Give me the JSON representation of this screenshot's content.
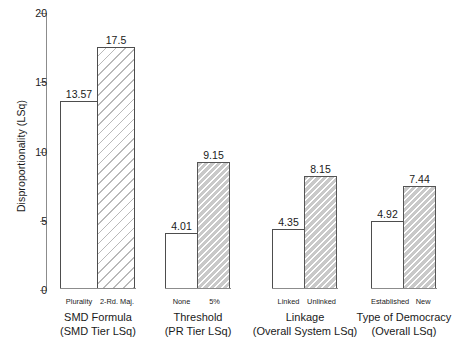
{
  "chart_data": {
    "type": "bar",
    "title": "",
    "xlabel": "",
    "ylabel": "Disproportionality (LSq)",
    "ylim": [
      0,
      20
    ],
    "yticks": [
      0,
      5,
      10,
      15,
      20
    ],
    "ytick_labels": [
      "0",
      "5",
      "10",
      "15",
      "20"
    ],
    "grid": false,
    "legend": "none",
    "groups": [
      {
        "name": "SMD Formula",
        "subtitle": "(SMD Tier LSq)",
        "bars": [
          {
            "category": "Plurality",
            "value": 13.57,
            "label": "13.57",
            "fill": "plain"
          },
          {
            "category": "2-Rd. Maj.",
            "value": 17.5,
            "label": "17.5",
            "fill": "hatch-light"
          }
        ]
      },
      {
        "name": "Threshold",
        "subtitle": "(PR Tier LSq)",
        "bars": [
          {
            "category": "None",
            "value": 4.01,
            "label": "4.01",
            "fill": "plain"
          },
          {
            "category": "5%",
            "value": 9.15,
            "label": "9.15",
            "fill": "hatch-dark"
          }
        ]
      },
      {
        "name": "Linkage",
        "subtitle": "(Overall System LSq)",
        "bars": [
          {
            "category": "Linked",
            "value": 4.35,
            "label": "4.35",
            "fill": "plain"
          },
          {
            "category": "Unlinked",
            "value": 8.15,
            "label": "8.15",
            "fill": "hatch-dark"
          }
        ]
      },
      {
        "name": "Type of Democracy",
        "subtitle": "(Overall LSq)",
        "bars": [
          {
            "category": "Established",
            "value": 4.92,
            "label": "4.92",
            "fill": "plain"
          },
          {
            "category": "New",
            "value": 7.44,
            "label": "7.44",
            "fill": "hatch-dark"
          }
        ]
      }
    ],
    "colors": {
      "axis": "#8c8c8c",
      "bar_outline": "#4d4d4d",
      "bar_plain_fill": "#ffffff",
      "hatch_light": "#b9b9b9",
      "hatch_dark_fill": "#c9c9c9",
      "text": "#1a1a1a"
    }
  }
}
